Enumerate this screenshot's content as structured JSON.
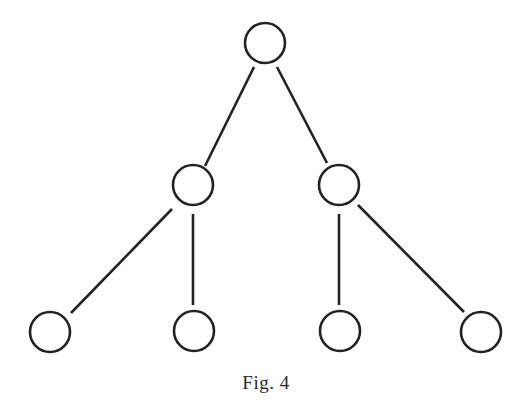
{
  "figure": {
    "caption": "Fig. 4",
    "stroke_color": "#222222",
    "background_color": "#ffffff",
    "node_radius": 20,
    "nodes": [
      {
        "id": "root",
        "level": 0,
        "cx": 265,
        "cy": 43
      },
      {
        "id": "left-child",
        "level": 1,
        "cx": 193,
        "cy": 185
      },
      {
        "id": "right-child",
        "level": 1,
        "cx": 339,
        "cy": 185
      },
      {
        "id": "leaf-1",
        "level": 2,
        "cx": 50,
        "cy": 332
      },
      {
        "id": "leaf-2",
        "level": 2,
        "cx": 194,
        "cy": 331
      },
      {
        "id": "leaf-3",
        "level": 2,
        "cx": 340,
        "cy": 331
      },
      {
        "id": "leaf-4",
        "level": 2,
        "cx": 481,
        "cy": 332
      }
    ],
    "edges": [
      {
        "from": "root",
        "to": "left-child",
        "x1": 254,
        "y1": 67,
        "x2": 205,
        "y2": 166
      },
      {
        "from": "root",
        "to": "right-child",
        "x1": 277,
        "y1": 67,
        "x2": 327,
        "y2": 163
      },
      {
        "from": "left-child",
        "to": "leaf-1",
        "x1": 172,
        "y1": 209,
        "x2": 71,
        "y2": 313
      },
      {
        "from": "left-child",
        "to": "leaf-2",
        "x1": 193,
        "y1": 214,
        "x2": 193,
        "y2": 305
      },
      {
        "from": "right-child",
        "to": "leaf-3",
        "x1": 339,
        "y1": 214,
        "x2": 339,
        "y2": 305
      },
      {
        "from": "right-child",
        "to": "leaf-4",
        "x1": 358,
        "y1": 205,
        "x2": 464,
        "y2": 312
      }
    ]
  }
}
